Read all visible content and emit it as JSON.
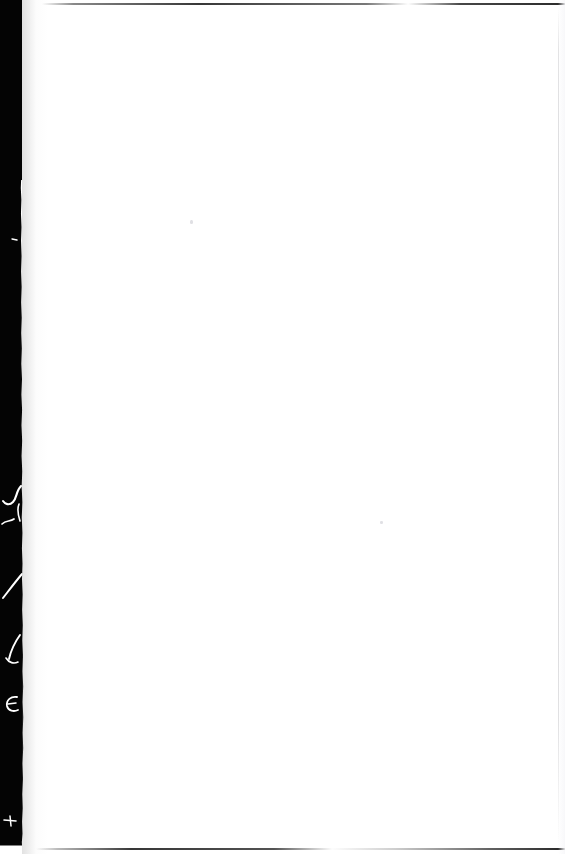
{
  "document": {
    "type": "scanned-page",
    "title": "Scanned blank page",
    "page_state": "blank",
    "orientation": "portrait",
    "width_px": 565,
    "height_px": 854,
    "background_color": "#ffffff"
  },
  "scan_artifacts": {
    "gutter": {
      "name": "binding-gutter-shadow",
      "position": "left",
      "color": "#040404",
      "min_width_px": 20,
      "max_width_px": 23
    },
    "edges": {
      "top_line_color": "#1a1a1a",
      "bottom_line_color": "#1a1a1a",
      "right_line_color": "#c6c6ca"
    },
    "bleed_marks": {
      "name": "white-bleed-through-marks",
      "color": "#ffffff",
      "count": 6,
      "description": "Faint white handwriting-like strokes visible inside the dark binding gutter"
    },
    "specks": {
      "name": "scan-dust-specks",
      "color": "#c6c6cd",
      "count": 2
    }
  },
  "content": {
    "text": "",
    "note": "No printed or handwritten text is visible on the page surface"
  }
}
